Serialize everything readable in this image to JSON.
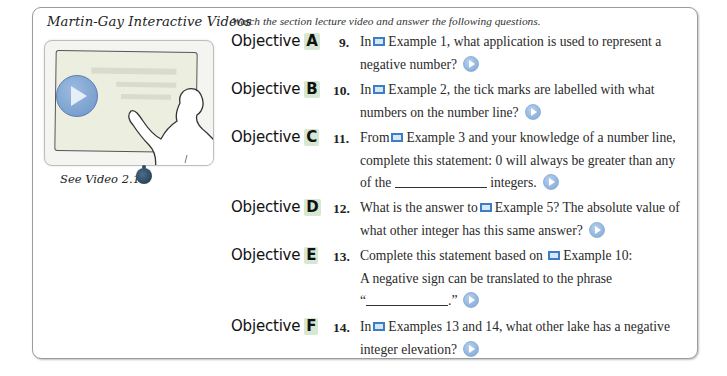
{
  "sidebar": {
    "heading": "Martin-Gay Interactive Videos",
    "see_video_label": "See Video 2.1",
    "thumbnail_icon": "video-lecture-thumbnail",
    "media_icon": "video-disc-icon"
  },
  "intro": "Watch the section lecture video and answer the following questions.",
  "objective_word": "Objective",
  "objectives": [
    {
      "letter": "A",
      "number": "9.",
      "lines": [
        "In",
        "Example 1, what application is used to represent a",
        "negative number?"
      ]
    },
    {
      "letter": "B",
      "number": "10.",
      "lines": [
        "In",
        "Example 2, the tick marks are labelled with what",
        "numbers on the number line?"
      ]
    },
    {
      "letter": "C",
      "number": "11.",
      "lines": [
        "From",
        "Example 3 and your knowledge of a number line,",
        "complete this statement: 0 will always be greater than any",
        "of the",
        "integers."
      ]
    },
    {
      "letter": "D",
      "number": "12.",
      "lines": [
        "What is the answer to",
        "Example 5? The absolute value of",
        "what other integer has this same answer?"
      ]
    },
    {
      "letter": "E",
      "number": "13.",
      "lines": [
        "Complete this statement based on",
        "Example 10:",
        "A negative sign can be translated to the phrase",
        "“",
        ".”"
      ]
    },
    {
      "letter": "F",
      "number": "14.",
      "lines": [
        "In",
        "Examples 13 and 14, what other lake has a negative",
        "integer elevation?"
      ]
    }
  ],
  "colors": {
    "objective_letter_bg": "#d6e8d2",
    "film_icon": "#3b7dc6",
    "play_icon": "#7aa4d4"
  }
}
